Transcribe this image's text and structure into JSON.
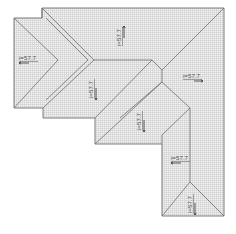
{
  "diagram": {
    "type": "roof-plan",
    "colors": {
      "outline": "#6e6e6e",
      "hatch": "#c8c8c8",
      "background": "#ffffff",
      "label": "#555555"
    },
    "slope_labels": [
      {
        "id": "left-wing",
        "text": "i=57.7",
        "orientation": "horizontal"
      },
      {
        "id": "upper-middle",
        "text": "i=57.7",
        "orientation": "vertical"
      },
      {
        "id": "left-lower",
        "text": "i=57.7",
        "orientation": "vertical"
      },
      {
        "id": "right-main",
        "text": "i=57.7",
        "orientation": "horizontal"
      },
      {
        "id": "center-diagonal",
        "text": "i=57.7",
        "orientation": "vertical"
      },
      {
        "id": "lower-right-wing",
        "text": "i=57.7",
        "orientation": "horizontal"
      },
      {
        "id": "bottom-gable",
        "text": "i=57.7",
        "orientation": "vertical"
      }
    ]
  }
}
